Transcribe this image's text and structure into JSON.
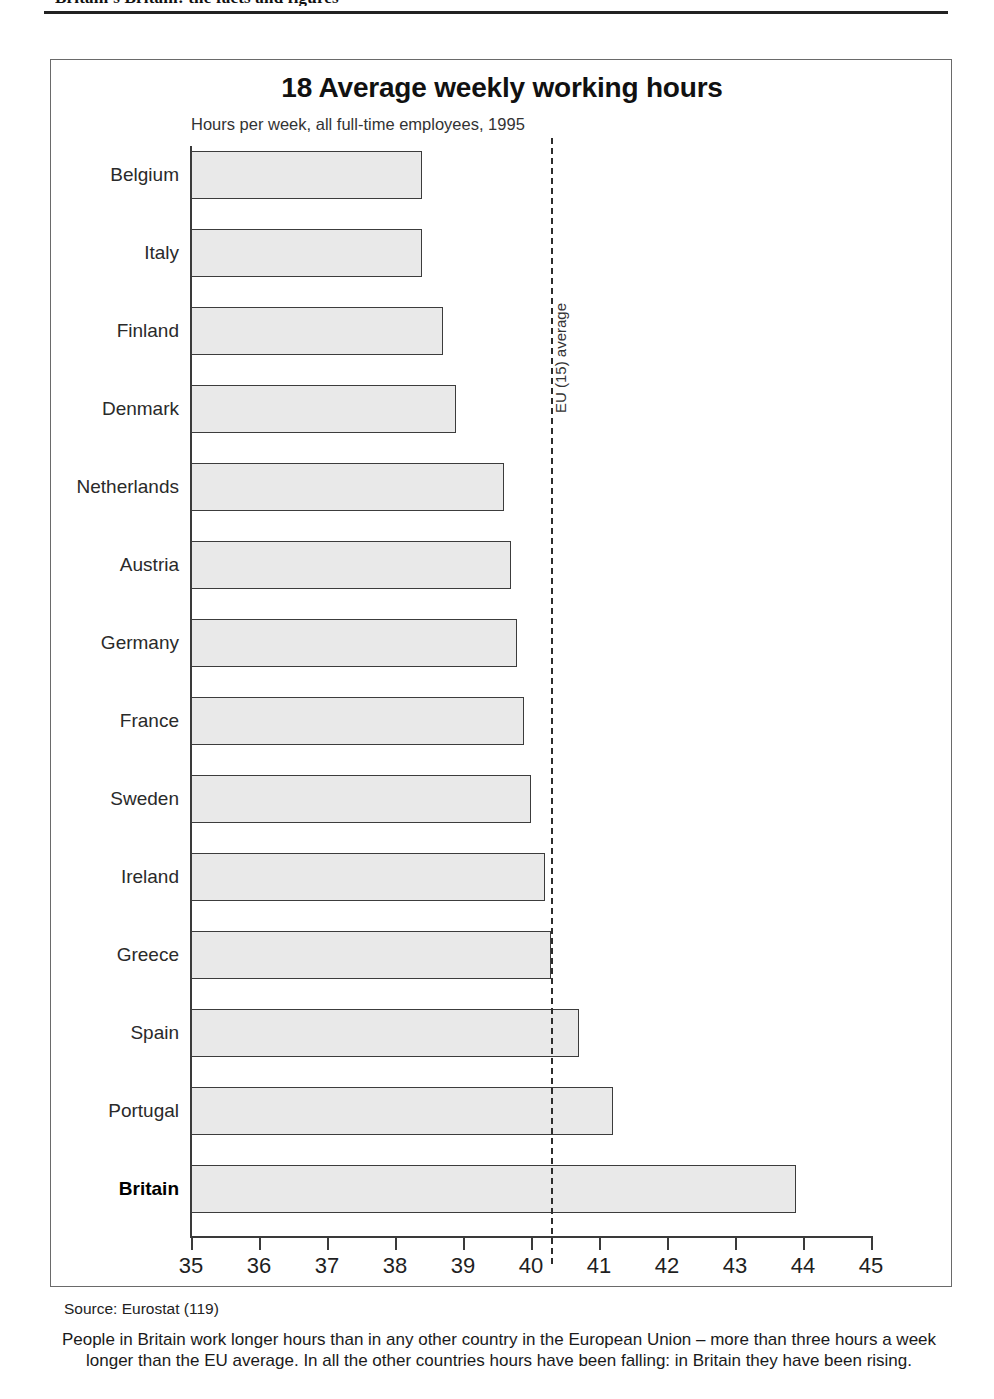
{
  "running_head": "Britain's Britain: the facts and figures",
  "chart": {
    "title": "18 Average weekly working hours",
    "subtitle": "Hours per week, all full-time employees, 1995",
    "eu_line_label": "EU (15) average",
    "source": "Source: Eurostat (119)",
    "caption": "People in Britain work longer hours than in any other country in the European Union – more than three hours a week longer than the EU average. In all the other countries hours have been falling: in Britain they have been rising."
  },
  "chart_data": {
    "type": "bar",
    "orientation": "horizontal",
    "title": "18 Average weekly working hours",
    "subtitle": "Hours per week, all full-time employees, 1995",
    "xlabel": "Hours per week",
    "ylabel": "",
    "xlim": [
      35,
      45
    ],
    "xticks": [
      35,
      36,
      37,
      38,
      39,
      40,
      41,
      42,
      43,
      44,
      45
    ],
    "xtick_labels": [
      "35",
      "36",
      "37",
      "38",
      "39",
      "40",
      "41",
      "42",
      "43",
      "44",
      "45"
    ],
    "grid": false,
    "legend": false,
    "categories": [
      "Belgium",
      "Italy",
      "Finland",
      "Denmark",
      "Netherlands",
      "Austria",
      "Germany",
      "France",
      "Sweden",
      "Ireland",
      "Greece",
      "Spain",
      "Portugal",
      "Britain"
    ],
    "values": [
      38.4,
      38.4,
      38.7,
      38.9,
      39.6,
      39.7,
      39.8,
      39.9,
      40.0,
      40.2,
      40.3,
      40.7,
      41.2,
      43.9
    ],
    "highlight_category": "Britain",
    "reference_line": {
      "label": "EU (15) average",
      "value": 40.3,
      "style": "dashed"
    },
    "bar_fill": "#e9e9e9",
    "bar_stroke": "#3c3c3c",
    "source": "Source: Eurostat (119)"
  }
}
